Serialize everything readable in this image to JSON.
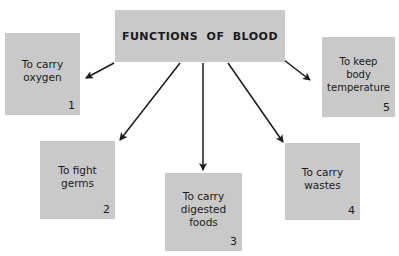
{
  "title": "FUNCTIONS OF BLOOD",
  "colors": {
    "box": "#c9c9c9",
    "arrow": "#1a1a1a",
    "background": "#ffffff"
  },
  "functions": [
    {
      "number": "1",
      "label": "To carry\noxygen"
    },
    {
      "number": "2",
      "label": "To fight\ngerms"
    },
    {
      "number": "3",
      "label": "To carry\ndigested\nfoods"
    },
    {
      "number": "4",
      "label": "To carry\nwastes"
    },
    {
      "number": "5",
      "label": "To keep\nbody\ntemperature"
    }
  ]
}
